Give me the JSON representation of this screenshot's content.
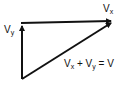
{
  "diagram": {
    "labels": {
      "vy": {
        "main": "V",
        "sub": "y"
      },
      "vx": {
        "main": "V",
        "sub": "x"
      },
      "sum": {
        "a_main": "V",
        "a_sub": "x",
        "plus": "+",
        "b_main": "V",
        "b_sub": "y",
        "equals": "=",
        "result": "V"
      }
    },
    "vectors": [
      {
        "name": "Vy",
        "from": [
          22,
          79
        ],
        "to": [
          22,
          24
        ]
      },
      {
        "name": "Vx",
        "from": [
          22,
          23
        ],
        "to": [
          114,
          21
        ]
      },
      {
        "name": "V",
        "from": [
          22,
          79
        ],
        "to": [
          114,
          22
        ]
      }
    ],
    "stroke_color": "#111111"
  }
}
